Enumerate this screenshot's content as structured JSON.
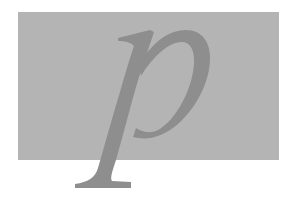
{
  "figure": {
    "letter": "p",
    "style": "italic serif",
    "colors": {
      "background": "#ffffff",
      "panel": "#b4b4b4",
      "letter": "#8e8e8e"
    }
  }
}
